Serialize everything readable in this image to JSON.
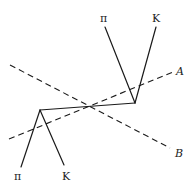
{
  "diagram": {
    "type": "particle-decay-vertex-diagram",
    "labels": {
      "top_pi": "π",
      "top_k": "K",
      "bottom_pi": "π",
      "bottom_k": "K",
      "axis_a": "A",
      "axis_b": "B"
    },
    "vertices": {
      "left": [
        40,
        110
      ],
      "right": [
        135,
        103
      ]
    },
    "tracks": {
      "top_pi": [
        [
          105,
          27
        ],
        [
          135,
          103
        ]
      ],
      "top_k": [
        [
          156,
          27
        ],
        [
          135,
          103
        ]
      ],
      "bottom_pi": [
        [
          40,
          110
        ],
        [
          21,
          167
        ]
      ],
      "bottom_k": [
        [
          40,
          110
        ],
        [
          64,
          165
        ]
      ],
      "connector": [
        [
          40,
          110
        ],
        [
          135,
          103
        ]
      ]
    },
    "axes": {
      "A": [
        [
          9,
          139
        ],
        [
          173,
          72
        ]
      ],
      "B": [
        [
          10,
          65
        ],
        [
          170,
          148
        ]
      ]
    },
    "colors": {
      "ink": "#1a1a1a",
      "background": "#ffffff"
    }
  }
}
